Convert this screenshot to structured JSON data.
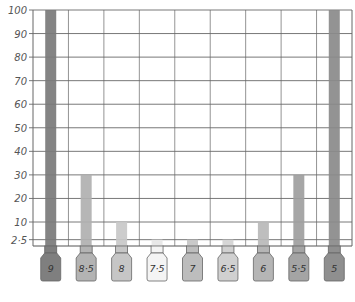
{
  "chart_data": {
    "type": "bar",
    "title": "",
    "xlabel": "",
    "ylabel": "",
    "categories": [
      "9",
      "8·5",
      "8",
      "7·5",
      "7",
      "6·5",
      "6",
      "5·5",
      "5"
    ],
    "values": [
      100,
      30,
      10,
      2.5,
      2.5,
      2.5,
      10,
      30,
      100
    ],
    "bar_colors": [
      "#7a7a7a",
      "#b0b0b0",
      "#c8c8c8",
      "#e6e6e6",
      "#c4c4c4",
      "#d2d2d2",
      "#b8b8b8",
      "#9e9e9e",
      "#8a8a8a"
    ],
    "bottle_colors": [
      "#7f7f7f",
      "#b3b3b3",
      "#c6c6c6",
      "#f4f4f4",
      "#bdbdbd",
      "#d0d0d0",
      "#b5b5b5",
      "#a4a4a4",
      "#8f8f8f"
    ],
    "yticks": [
      2.5,
      10,
      20,
      30,
      40,
      50,
      60,
      70,
      80,
      90,
      100
    ],
    "ytick_labels": [
      "2·5",
      "10",
      "20",
      "30",
      "40",
      "50",
      "60",
      "70",
      "80",
      "90",
      "100"
    ],
    "ylim": [
      0,
      100
    ],
    "grid": true,
    "legend": null
  }
}
